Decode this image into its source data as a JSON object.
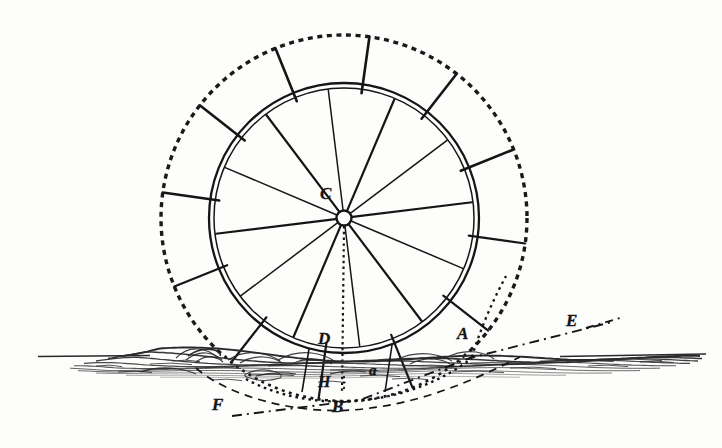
{
  "figure": {
    "background_color": "#fdfdfc",
    "ink_color": "#151515"
  },
  "labels": [
    {
      "id": "C",
      "text": "C",
      "x": 320,
      "y": 185,
      "size": 17,
      "desc": "wheel-centre-hub"
    },
    {
      "id": "D",
      "text": "D",
      "x": 318,
      "y": 330,
      "size": 17,
      "desc": "point-on-rim-at-waterline"
    },
    {
      "id": "H",
      "text": "H",
      "x": 318,
      "y": 374,
      "size": 16,
      "desc": "point-below-waterline"
    },
    {
      "id": "B",
      "text": "B",
      "x": 332,
      "y": 398,
      "size": 17,
      "desc": "lowest-point-of-float-path"
    },
    {
      "id": "a",
      "text": "a",
      "x": 369,
      "y": 363,
      "size": 15,
      "desc": "intermediate-point"
    },
    {
      "id": "A",
      "text": "A",
      "x": 457,
      "y": 325,
      "size": 17,
      "desc": "float-entry-point"
    },
    {
      "id": "E",
      "text": "E",
      "x": 566,
      "y": 312,
      "size": 17,
      "desc": "right-end-of-datum-line"
    },
    {
      "id": "F",
      "text": "F",
      "x": 212,
      "y": 396,
      "size": 17,
      "desc": "left-end-of-datum-line"
    }
  ],
  "geometry": {
    "centre": {
      "x": 344,
      "y": 218
    },
    "inner_rim_radius": 135,
    "inner_rim_inner_radius": 130,
    "outer_float_circle_radius": 183,
    "float_count": 12,
    "float_start_angle_deg": -8,
    "waterline_y": 357,
    "water_extent": {
      "x_left": 38,
      "x_right": 706
    }
  },
  "chart_data": {
    "type": "diagram",
    "elements": [
      "inner double-line rim circle",
      "twelve radial floats reaching outer dotted circle",
      "twelve spokes meeting at hub C",
      "vertical dotted radius C to B",
      "hatched water surface with wave crests",
      "dashed circular arc through B",
      "dotted circular arc through A and B",
      "dash-dot datum line from F through B to E"
    ],
    "points": [
      "A",
      "B",
      "C",
      "D",
      "E",
      "F",
      "H",
      "a"
    ]
  }
}
